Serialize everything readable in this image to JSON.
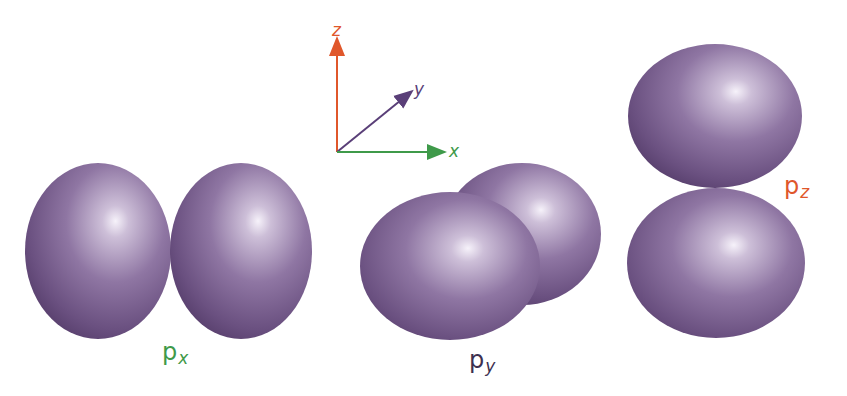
{
  "diagram": {
    "lobe_colors": {
      "base": "#6d5382",
      "dark": "#4e3862",
      "highlight": "#f6f2fa",
      "mid": "#a58fb6"
    },
    "axes": {
      "x": {
        "label": "x",
        "color": "#3f9a4a"
      },
      "y": {
        "label": "y",
        "color": "#5a3f78"
      },
      "z": {
        "label": "z",
        "color": "#e0572b"
      }
    },
    "orbitals": [
      {
        "name": "px",
        "label_main": "p",
        "label_sub": "x",
        "color": "#3f9a4a"
      },
      {
        "name": "py",
        "label_main": "p",
        "label_sub": "y",
        "color": "#3d3050"
      },
      {
        "name": "pz",
        "label_main": "p",
        "label_sub": "z",
        "color": "#e0572b"
      }
    ]
  }
}
